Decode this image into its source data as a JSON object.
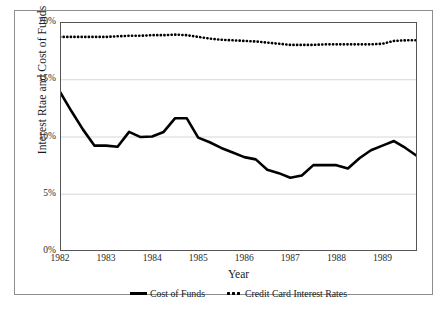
{
  "chart_data": {
    "type": "line",
    "title": "",
    "xlabel": "Year",
    "ylabel": "Interest Rtae and Cost of Funds",
    "xlim": [
      1982.0,
      1989.75
    ],
    "ylim": [
      0,
      20
    ],
    "yticks": [
      "0%",
      "5%",
      "10%",
      "15%",
      "20%"
    ],
    "ytick_values": [
      0,
      5,
      10,
      15,
      20
    ],
    "xticks": [
      "1982",
      "1983",
      "1984",
      "1985",
      "1986",
      "1987",
      "1988",
      "1989"
    ],
    "xtick_values": [
      1982,
      1983,
      1984,
      1985,
      1986,
      1987,
      1988,
      1989
    ],
    "grid": "horizontal",
    "legend_position": "bottom-center",
    "x": [
      1982.0,
      1982.25,
      1982.5,
      1982.75,
      1983.0,
      1983.25,
      1983.5,
      1983.75,
      1984.0,
      1984.25,
      1984.5,
      1984.75,
      1985.0,
      1985.25,
      1985.5,
      1985.75,
      1986.0,
      1986.25,
      1986.5,
      1986.75,
      1987.0,
      1987.25,
      1987.5,
      1987.75,
      1988.0,
      1988.25,
      1988.5,
      1988.75,
      1989.0,
      1989.25,
      1989.5,
      1989.75
    ],
    "series": [
      {
        "name": "Cost of Funds",
        "style": "solid",
        "color": "#000000",
        "values": [
          13.9,
          12.2,
          10.6,
          9.2,
          9.2,
          9.1,
          10.4,
          9.95,
          10.0,
          10.4,
          11.6,
          11.6,
          9.9,
          9.5,
          9.0,
          8.6,
          8.2,
          8.0,
          7.1,
          6.8,
          6.4,
          6.6,
          7.5,
          7.5,
          7.5,
          7.2,
          8.1,
          8.8,
          9.2,
          9.6,
          9.0,
          8.3
        ]
      },
      {
        "name": "Credit Card Interest Rates",
        "style": "dotted",
        "color": "#000000",
        "values": [
          18.7,
          18.7,
          18.7,
          18.7,
          18.7,
          18.75,
          18.8,
          18.8,
          18.85,
          18.85,
          18.9,
          18.85,
          18.7,
          18.55,
          18.45,
          18.4,
          18.35,
          18.3,
          18.2,
          18.1,
          18.0,
          18.0,
          18.0,
          18.05,
          18.05,
          18.05,
          18.05,
          18.05,
          18.1,
          18.35,
          18.4,
          18.4
        ]
      }
    ]
  },
  "legend": {
    "items": [
      {
        "label": "Cost of Funds",
        "style": "solid"
      },
      {
        "label": "Credit Card Interest Rates",
        "style": "dotted"
      }
    ]
  }
}
